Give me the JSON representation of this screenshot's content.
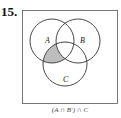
{
  "problem_number": "15.",
  "diagram": {
    "sets": [
      {
        "name": "A"
      },
      {
        "name": "B"
      },
      {
        "name": "C"
      }
    ],
    "shaded_region": "A and C, not B",
    "shade_color": "#bdbdbd",
    "stroke_color": "#333333"
  },
  "caption": "(A ∩ B′) ∩ C"
}
